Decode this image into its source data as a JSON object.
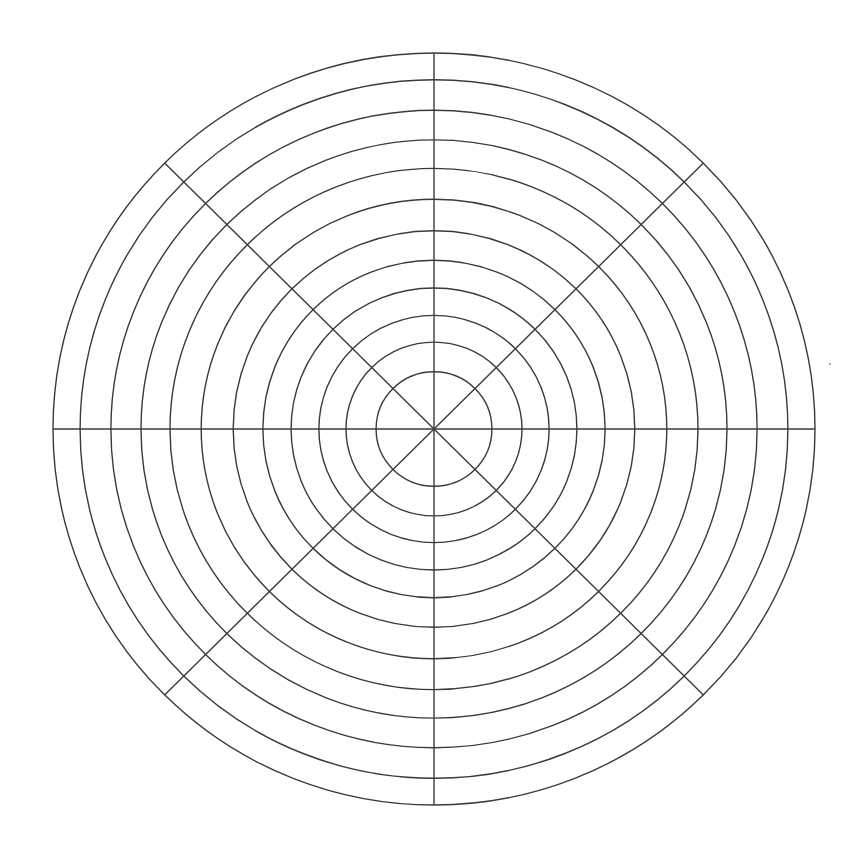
{
  "diagram": {
    "type": "polar-grid",
    "center": [
      434,
      429
    ],
    "outer_radius_x": 381,
    "outer_radius_y": 376,
    "ring_radii_fraction": [
      0.152,
      0.231,
      0.302,
      0.375,
      0.449,
      0.527,
      0.611,
      0.693,
      0.769,
      0.848,
      0.929,
      1.0
    ],
    "ring_count": 12,
    "spoke_angles_deg": [
      0,
      45,
      90,
      135,
      180,
      225,
      270,
      315
    ],
    "spoke_count": 8,
    "line_color": "#3a3a3a",
    "background_color": "#ffffff",
    "labels": []
  }
}
